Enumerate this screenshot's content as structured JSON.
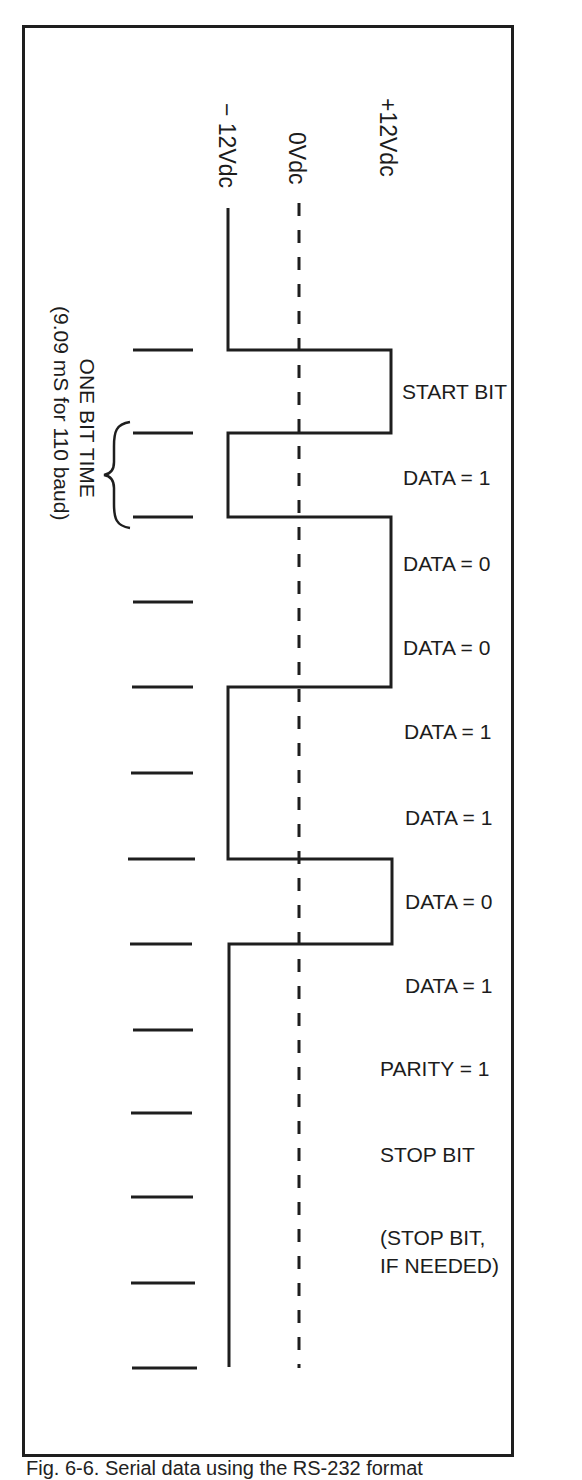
{
  "figure": {
    "caption": "Fig. 6-6. Serial data using the RS-232 format",
    "voltage_labels": {
      "neg": "− 12Vdc",
      "zero": "0Vdc",
      "pos": "+12Vdc"
    },
    "bit_time_note": {
      "line1": "ONE BIT TIME",
      "line2": "(9.09 mS for 110 baud)"
    },
    "bits": [
      {
        "label": "START BIT",
        "level": "+12"
      },
      {
        "label": "DATA = 1",
        "level": "-12"
      },
      {
        "label": "DATA = 0",
        "level": "+12"
      },
      {
        "label": "DATA = 0",
        "level": "+12"
      },
      {
        "label": "DATA = 1",
        "level": "-12"
      },
      {
        "label": "DATA = 1",
        "level": "-12"
      },
      {
        "label": "DATA = 0",
        "level": "+12"
      },
      {
        "label": "DATA = 1",
        "level": "-12"
      },
      {
        "label": "PARITY = 1",
        "level": "-12"
      },
      {
        "label": "STOP BIT",
        "level": "-12"
      },
      {
        "label_line1": "(STOP BIT,",
        "label_line2": "IF NEEDED)",
        "level": "-12"
      }
    ],
    "colors": {
      "ink": "#1e1e1e",
      "paper": "#ffffff"
    }
  }
}
